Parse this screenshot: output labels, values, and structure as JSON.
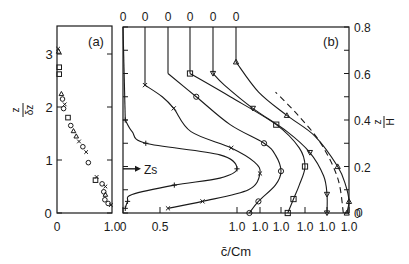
{
  "chart_data": [
    {
      "panel": "(a)",
      "type": "scatter",
      "title": "(a)",
      "xlabel": "",
      "ylabel": "z / δz",
      "xlim": [
        0,
        1.0
      ],
      "ylim": [
        0,
        3.5
      ],
      "x_ticks": [
        "0",
        "1.0"
      ],
      "y_ticks": [
        "0",
        "1",
        "2",
        "3"
      ],
      "grid": false,
      "points": [
        {
          "x": 0.02,
          "y": 3.1,
          "marker": "x"
        },
        {
          "x": 0.03,
          "y": 3.05,
          "marker": "triangle"
        },
        {
          "x": 0.04,
          "y": 2.75,
          "marker": "square"
        },
        {
          "x": 0.04,
          "y": 2.62,
          "marker": "square"
        },
        {
          "x": 0.08,
          "y": 2.25,
          "marker": "triangle"
        },
        {
          "x": 0.1,
          "y": 2.15,
          "marker": "circle"
        },
        {
          "x": 0.14,
          "y": 2.05,
          "marker": "x"
        },
        {
          "x": 0.12,
          "y": 1.97,
          "marker": "circle"
        },
        {
          "x": 0.2,
          "y": 1.8,
          "marker": "square"
        },
        {
          "x": 0.25,
          "y": 1.65,
          "marker": "circle"
        },
        {
          "x": 0.3,
          "y": 1.55,
          "marker": "triangle"
        },
        {
          "x": 0.35,
          "y": 1.45,
          "marker": "triangle"
        },
        {
          "x": 0.4,
          "y": 1.35,
          "marker": "x"
        },
        {
          "x": 0.47,
          "y": 1.25,
          "marker": "circle"
        },
        {
          "x": 0.53,
          "y": 1.15,
          "marker": "x"
        },
        {
          "x": 0.57,
          "y": 0.95,
          "marker": "circle"
        },
        {
          "x": 0.72,
          "y": 0.68,
          "marker": "x"
        },
        {
          "x": 0.7,
          "y": 0.62,
          "marker": "square"
        },
        {
          "x": 0.82,
          "y": 0.55,
          "marker": "circle"
        },
        {
          "x": 0.88,
          "y": 0.5,
          "marker": "x"
        },
        {
          "x": 0.85,
          "y": 0.4,
          "marker": "circle"
        },
        {
          "x": 0.88,
          "y": 0.35,
          "marker": "triangle"
        },
        {
          "x": 0.87,
          "y": 0.25,
          "marker": "circle"
        },
        {
          "x": 0.93,
          "y": 0.18,
          "marker": "circle"
        },
        {
          "x": 0.98,
          "y": 0.15,
          "marker": "x"
        }
      ]
    },
    {
      "panel": "(b)",
      "type": "line",
      "title": "(b)",
      "xlabel": "c̄/Cm",
      "ylabel": "z/H",
      "ylim": [
        0,
        0.8
      ],
      "y_ticks": [
        "0",
        "0.2",
        "0.4",
        "0.6",
        "0.8"
      ],
      "x_ticks_bottom": [
        "0",
        "0.5",
        "1.0",
        "1.0",
        "1.0",
        "1.0",
        "1.0",
        "1.0"
      ],
      "x_ticks_top": [
        "0",
        "0",
        "0",
        "0",
        "0",
        "0"
      ],
      "annotation": "Zs",
      "annotation_z": 0.19,
      "grid": false,
      "note": "Stacked vertical profiles of c̄/Cm vs z/H, each shifted horizontally; each profile starts at its top '0' and peaks at its bottom '1.0'",
      "series": [
        {
          "name": "profile 1",
          "marker": "plus",
          "points": [
            [
              0.02,
              0.02
            ],
            [
              0.04,
              0.05
            ],
            [
              0.08,
              0.08
            ],
            [
              0.45,
              0.12
            ],
            [
              0.85,
              0.15
            ],
            [
              1.0,
              0.19
            ],
            [
              0.85,
              0.25
            ],
            [
              0.2,
              0.3
            ],
            [
              0.08,
              0.35
            ],
            [
              0.02,
              0.4
            ]
          ]
        },
        {
          "name": "profile 2",
          "marker": "x",
          "points": [
            [
              0.2,
              0.02
            ],
            [
              0.5,
              0.05
            ],
            [
              0.9,
              0.1
            ],
            [
              1.0,
              0.17
            ],
            [
              0.95,
              0.22
            ],
            [
              0.75,
              0.28
            ],
            [
              0.4,
              0.35
            ],
            [
              0.25,
              0.45
            ],
            [
              0.15,
              0.5
            ],
            [
              0.0,
              0.55
            ]
          ]
        },
        {
          "name": "profile 3",
          "marker": "circle",
          "points": [
            [
              0.72,
              0.0
            ],
            [
              0.8,
              0.05
            ],
            [
              0.95,
              0.12
            ],
            [
              1.0,
              0.18
            ],
            [
              0.95,
              0.25
            ],
            [
              0.85,
              0.3
            ],
            [
              0.55,
              0.38
            ],
            [
              0.25,
              0.5
            ],
            [
              0.0,
              0.6
            ]
          ]
        },
        {
          "name": "profile 4",
          "marker": "square",
          "points": [
            [
              0.85,
              0.0
            ],
            [
              0.9,
              0.06
            ],
            [
              0.95,
              0.12
            ],
            [
              1.0,
              0.2
            ],
            [
              0.95,
              0.28
            ],
            [
              0.75,
              0.38
            ],
            [
              0.35,
              0.5
            ],
            [
              0.0,
              0.6
            ]
          ]
        },
        {
          "name": "profile 5",
          "marker": "triangle-down",
          "points": [
            [
              1.0,
              0.0
            ],
            [
              1.0,
              0.08
            ],
            [
              0.97,
              0.16
            ],
            [
              0.85,
              0.26
            ],
            [
              0.65,
              0.35
            ],
            [
              0.35,
              0.45
            ],
            [
              0.1,
              0.55
            ],
            [
              0.0,
              0.6
            ]
          ]
        },
        {
          "name": "profile 6",
          "marker": "triangle-up",
          "points": [
            [
              0.98,
              0.0
            ],
            [
              1.0,
              0.05
            ],
            [
              0.97,
              0.12
            ],
            [
              0.9,
              0.2
            ],
            [
              0.7,
              0.33
            ],
            [
              0.45,
              0.42
            ],
            [
              0.2,
              0.52
            ],
            [
              0.0,
              0.65
            ]
          ]
        },
        {
          "name": "profile 6 (dashed)",
          "style": "dashed",
          "points": [
            [
              0.95,
              0.0
            ],
            [
              0.9,
              0.15
            ],
            [
              0.75,
              0.3
            ],
            [
              0.55,
              0.42
            ],
            [
              0.35,
              0.52
            ]
          ]
        }
      ]
    }
  ]
}
